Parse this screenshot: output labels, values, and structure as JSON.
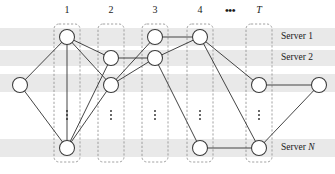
{
  "figure": {
    "width": 335,
    "height": 174,
    "background_color": "#ffffff",
    "band_color": "#e9e9e9",
    "node_stroke_color": "#3b3b3b",
    "node_fill_color": "#ffffff",
    "edge_color": "#3b3b3b",
    "slotbox_stroke_color": "#8a8a8a"
  },
  "column_labels": [
    {
      "text": "1",
      "italic": false,
      "x": 67,
      "y": 13
    },
    {
      "text": "2",
      "italic": false,
      "x": 111,
      "y": 13
    },
    {
      "text": "3",
      "italic": false,
      "x": 155,
      "y": 13
    },
    {
      "text": "4",
      "italic": false,
      "x": 200,
      "y": 13
    },
    {
      "text": "T",
      "italic": true,
      "x": 259,
      "y": 13
    }
  ],
  "horizontal_ellipsis": {
    "text": "•••",
    "x": 230,
    "y": 14
  },
  "row_labels": [
    {
      "text": "Server ",
      "emph": "1",
      "x": 281,
      "y": 37
    },
    {
      "text": "Server ",
      "emph": "2",
      "x": 281,
      "y": 58
    },
    {
      "text": "Server ",
      "emph": "N",
      "emph_italic": true,
      "x": 281,
      "y": 148
    }
  ],
  "slot_boxes": [
    {
      "name": "slot-1",
      "x": 54,
      "y": 24,
      "width": 26,
      "height": 138
    },
    {
      "name": "slot-2",
      "x": 98,
      "y": 24,
      "width": 26,
      "height": 138
    },
    {
      "name": "slot-3",
      "x": 142,
      "y": 24,
      "width": 26,
      "height": 138
    },
    {
      "name": "slot-4",
      "x": 187,
      "y": 24,
      "width": 26,
      "height": 138
    },
    {
      "name": "slot-T",
      "x": 246,
      "y": 24,
      "width": 26,
      "height": 138
    }
  ],
  "bands": [
    {
      "name": "band-server-1",
      "x": 0,
      "y": 28,
      "width": 335,
      "height": 18
    },
    {
      "name": "band-server-2",
      "x": 0,
      "y": 50,
      "width": 335,
      "height": 16
    },
    {
      "name": "band-row-3",
      "x": 0,
      "y": 74,
      "width": 335,
      "height": 18
    },
    {
      "name": "band-server-n",
      "x": 0,
      "y": 139,
      "width": 335,
      "height": 18
    }
  ],
  "column_ellipses": [
    {
      "x": 67,
      "y": 115
    },
    {
      "x": 111,
      "y": 115
    },
    {
      "x": 155,
      "y": 115
    },
    {
      "x": 200,
      "y": 115
    },
    {
      "x": 259,
      "y": 115
    }
  ],
  "nodes": [
    {
      "id": "in",
      "label": "source-node",
      "x": 20,
      "y": 85,
      "r": 7.5
    },
    {
      "id": "c1a",
      "label": "slot1-server1",
      "x": 67,
      "y": 37,
      "r": 7.5
    },
    {
      "id": "c1b",
      "label": "slot1-serverN",
      "x": 67,
      "y": 148,
      "r": 7.5
    },
    {
      "id": "c2a",
      "label": "slot2-server2",
      "x": 111,
      "y": 58,
      "r": 7.5
    },
    {
      "id": "c2b",
      "label": "slot2-row3",
      "x": 111,
      "y": 85,
      "r": 7.5
    },
    {
      "id": "c3a",
      "label": "slot3-server1",
      "x": 155,
      "y": 37,
      "r": 7.5
    },
    {
      "id": "c3b",
      "label": "slot3-server2",
      "x": 155,
      "y": 58,
      "r": 7.5
    },
    {
      "id": "c4a",
      "label": "slot4-server1",
      "x": 200,
      "y": 37,
      "r": 7.5
    },
    {
      "id": "c4b",
      "label": "slot4-serverN",
      "x": 200,
      "y": 148,
      "r": 7.5
    },
    {
      "id": "cTa",
      "label": "slotT-row3",
      "x": 259,
      "y": 85,
      "r": 7.5
    },
    {
      "id": "cTb",
      "label": "slotT-serverN",
      "x": 259,
      "y": 148,
      "r": 7.5
    },
    {
      "id": "out",
      "label": "sink-node",
      "x": 319,
      "y": 85,
      "r": 7.5
    }
  ],
  "edges": [
    {
      "from": "in",
      "to": "c1a"
    },
    {
      "from": "in",
      "to": "c1b"
    },
    {
      "from": "c1a",
      "to": "c2a"
    },
    {
      "from": "c1a",
      "to": "c2b"
    },
    {
      "from": "c1a",
      "to": "c1b"
    },
    {
      "from": "c1b",
      "to": "c2b"
    },
    {
      "from": "c1b",
      "to": "c2a"
    },
    {
      "from": "c2a",
      "to": "c3b"
    },
    {
      "from": "c2b",
      "to": "c3a"
    },
    {
      "from": "c2b",
      "to": "c3b"
    },
    {
      "from": "c3a",
      "to": "c4a"
    },
    {
      "from": "c3b",
      "to": "c4a"
    },
    {
      "from": "c3b",
      "to": "c4b"
    },
    {
      "from": "c4a",
      "to": "cTa"
    },
    {
      "from": "c4a",
      "to": "cTb"
    },
    {
      "from": "c4b",
      "to": "cTb"
    },
    {
      "from": "cTa",
      "to": "out"
    },
    {
      "from": "cTb",
      "to": "out"
    }
  ]
}
